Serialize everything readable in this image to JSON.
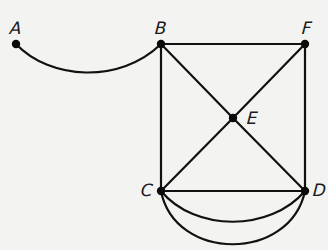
{
  "diagram": {
    "type": "graph",
    "nodes": [
      {
        "id": "A",
        "label": "A",
        "x": 16,
        "y": 44,
        "label_x": 10,
        "label_y": 20
      },
      {
        "id": "B",
        "label": "B",
        "x": 161,
        "y": 44,
        "label_x": 155,
        "label_y": 20
      },
      {
        "id": "F",
        "label": "F",
        "x": 305,
        "y": 44,
        "label_x": 302,
        "label_y": 20
      },
      {
        "id": "E",
        "label": "E",
        "x": 233,
        "y": 118,
        "label_x": 247,
        "label_y": 110
      },
      {
        "id": "C",
        "label": "C",
        "x": 161,
        "y": 191,
        "label_x": 141,
        "label_y": 182
      },
      {
        "id": "D",
        "label": "D",
        "x": 305,
        "y": 191,
        "label_x": 313,
        "label_y": 182
      }
    ],
    "edges": [
      {
        "from": "A",
        "to": "B",
        "shape": "curve",
        "path": "M16,44 C50,80 120,84 161,44"
      },
      {
        "from": "B",
        "to": "F",
        "shape": "line",
        "path": "M161,44 L305,44"
      },
      {
        "from": "B",
        "to": "C",
        "shape": "line",
        "path": "M161,44 L161,191"
      },
      {
        "from": "F",
        "to": "D",
        "shape": "line",
        "path": "M305,44 L305,191"
      },
      {
        "from": "B",
        "to": "E",
        "shape": "line",
        "path": "M161,44 L233,118"
      },
      {
        "from": "E",
        "to": "D",
        "shape": "line",
        "path": "M233,118 L305,191"
      },
      {
        "from": "F",
        "to": "E",
        "shape": "line",
        "path": "M305,44 L233,118"
      },
      {
        "from": "E",
        "to": "C",
        "shape": "line",
        "path": "M233,118 L161,191"
      },
      {
        "from": "C",
        "to": "D",
        "shape": "line",
        "path": "M161,191 L305,191"
      },
      {
        "from": "C",
        "to": "D",
        "shape": "curve",
        "path": "M161,191 C195,232 270,232 305,191"
      },
      {
        "from": "C",
        "to": "D",
        "shape": "curve",
        "path": "M161,191 C175,262 290,262 305,191"
      }
    ]
  }
}
